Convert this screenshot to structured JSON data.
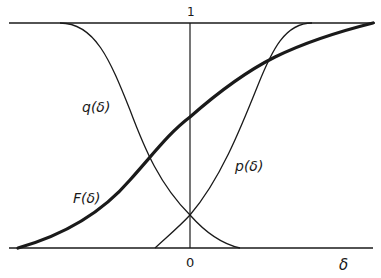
{
  "diagram": {
    "axis_labels": {
      "top": "1",
      "origin": "0",
      "x_variable": "δ"
    },
    "curves": [
      {
        "id": "F",
        "label": "F(δ)",
        "style": "thick",
        "description": "cumulative distribution rising from 0 to 1"
      },
      {
        "id": "q",
        "label": "q(δ)",
        "style": "thin",
        "description": "decreasing from 1 to 0"
      },
      {
        "id": "p",
        "label": "p(δ)",
        "style": "thin",
        "description": "increasing from 0 to 1"
      }
    ],
    "colors": {
      "ink": "#1a1a1a",
      "background": "#ffffff"
    }
  }
}
